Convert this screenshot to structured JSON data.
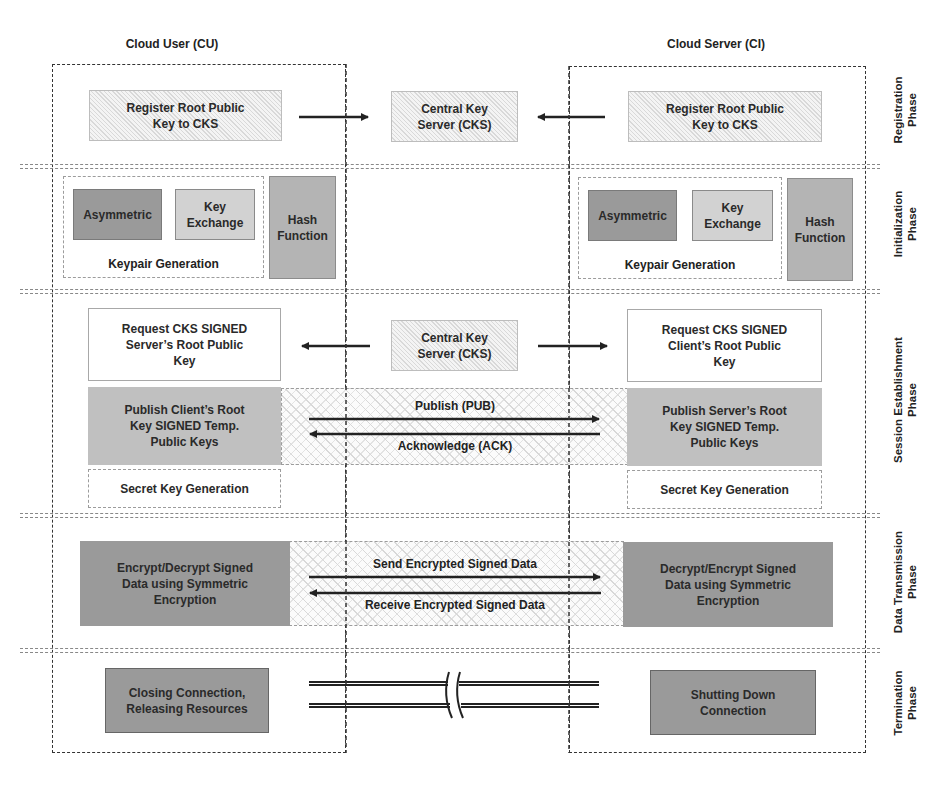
{
  "parties": {
    "left_title": "Cloud User (CU)",
    "right_title": "Cloud Server (CI)"
  },
  "phases": [
    {
      "id": "registration",
      "label_line1": "Registration",
      "label_line2": "Phase"
    },
    {
      "id": "initialization",
      "label_line1": "Initialization",
      "label_line2": "Phase"
    },
    {
      "id": "session",
      "label_line1": "Session Establishment",
      "label_line2": "Phase"
    },
    {
      "id": "data",
      "label_line1": "Data Transmission",
      "label_line2": "Phase"
    },
    {
      "id": "termination",
      "label_line1": "Termination",
      "label_line2": "Phase"
    }
  ],
  "registration": {
    "left_box": "Register Root Public Key to CKS",
    "center_box": "Central Key Server (CKS)",
    "right_box": "Register Root Public Key to CKS"
  },
  "initialization": {
    "left": {
      "asymmetric": "Asymmetric",
      "key_exchange": "Key Exchange",
      "hash": "Hash Function",
      "group_label": "Keypair Generation"
    },
    "right": {
      "asymmetric": "Asymmetric",
      "key_exchange": "Key Exchange",
      "hash": "Hash Function",
      "group_label": "Keypair Generation"
    }
  },
  "session": {
    "left_request": "Request CKS SIGNED Server’s Root Public Key",
    "center_box": "Central Key Server (CKS)",
    "right_request": "Request CKS SIGNED Client’s Root Public Key",
    "left_publish": "Publish Client’s Root Key SIGNED Temp. Public Keys",
    "right_publish": "Publish Server’s Root Key SIGNED Temp. Public Keys",
    "publish_msg": "Publish (PUB)",
    "ack_msg": "Acknowledge (ACK)",
    "left_secret": "Secret Key Generation",
    "right_secret": "Secret Key Generation"
  },
  "data_transmission": {
    "left_box": "Encrypt/Decrypt Signed Data using Symmetric Encryption",
    "right_box": "Decrypt/Encrypt Signed Data using Symmetric Encryption",
    "send_msg": "Send Encrypted Signed Data",
    "receive_msg": "Receive Encrypted Signed Data"
  },
  "termination": {
    "left_box": "Closing Connection, Releasing Resources",
    "right_box": "Shutting Down Connection"
  },
  "colors": {
    "dark_box": "#9a9a9a",
    "mid_box": "#b4b4b4",
    "light_box": "#d2d2d2",
    "line": "#222222"
  }
}
